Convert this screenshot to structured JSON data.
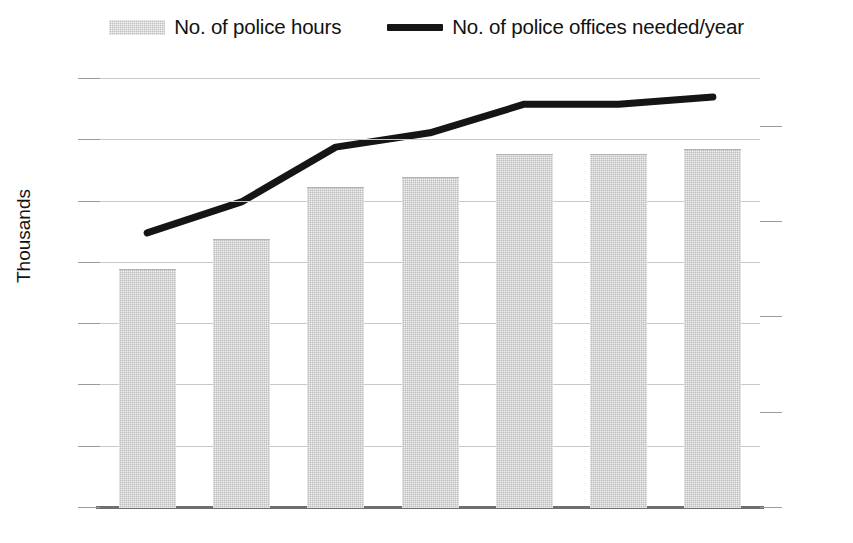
{
  "chart_data": {
    "type": "bar",
    "title": "",
    "xlabel": "",
    "ylabel": "Thousands",
    "y2label": "",
    "categories": [
      "2009",
      "2010",
      "2011",
      "2012",
      "2013",
      "2014",
      "2015"
    ],
    "series": [
      {
        "name": "No. of police hours",
        "type": "bar",
        "axis": "left",
        "color": "#bcbcbc",
        "values": [
          194,
          219,
          261,
          269,
          288,
          288,
          292
        ]
      },
      {
        "name": "No. of police offices needed/year",
        "type": "line",
        "axis": "right",
        "color": "#151515",
        "values": [
          115,
          128,
          151,
          157,
          169,
          169,
          172
        ]
      }
    ],
    "ylim": [
      0,
      350
    ],
    "yticks": [
      0,
      50,
      100,
      150,
      200,
      250,
      300,
      350
    ],
    "y2lim": [
      0,
      180
    ],
    "y2ticks": [
      0,
      20,
      40,
      60,
      80,
      100,
      120,
      140,
      160,
      180
    ],
    "grid": true,
    "legend_position": "top"
  },
  "legend": {
    "items": [
      {
        "label": "No. of police hours",
        "marker": "bar-swatch"
      },
      {
        "label": "No. of police offices needed/year",
        "marker": "line-swatch"
      }
    ]
  },
  "axes": {
    "left_title": "Thousands",
    "left_ticks": [
      "350",
      "300",
      "250",
      "200",
      "150",
      "100",
      "50",
      "0"
    ],
    "right_ticks": [
      "180",
      "160",
      "140",
      "120",
      "100",
      "80",
      "60",
      "40",
      "20",
      "0"
    ],
    "x_ticks": [
      "2009",
      "2010",
      "2011",
      "2012",
      "2013",
      "2014",
      "2015"
    ]
  },
  "colors": {
    "bar_fill": "#bcbcbc",
    "line_stroke": "#151515",
    "gridline": "#c9c9c9",
    "axis": "#6f6f6f",
    "text": "#121212"
  }
}
